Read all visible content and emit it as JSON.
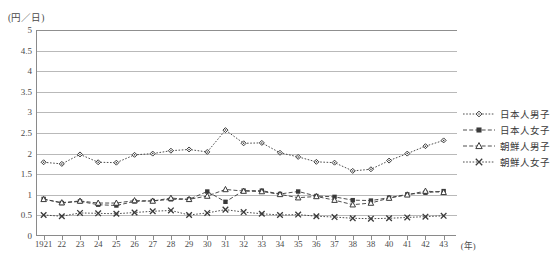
{
  "chart_data": {
    "type": "line",
    "title": "",
    "ylabel": "(円／日)",
    "xlabel": "(年)",
    "ylim": [
      0,
      5
    ],
    "yticks": [
      "0",
      "0.5",
      "1",
      "1.5",
      "2",
      "2.5",
      "3",
      "3.5",
      "4",
      "4.5",
      "5"
    ],
    "grid": true,
    "legend_position": "right",
    "x": [
      "1921",
      "22",
      "23",
      "24",
      "25",
      "26",
      "27",
      "28",
      "29",
      "30",
      "31",
      "32",
      "33",
      "34",
      "35",
      "36",
      "37",
      "38",
      "38",
      "40",
      "41",
      "42",
      "43"
    ],
    "xtick_unit_label": "(年)",
    "series": [
      {
        "name": "日本人男子",
        "marker": "diamond",
        "line": "dotted",
        "values": [
          1.79,
          1.75,
          1.98,
          1.79,
          1.78,
          1.97,
          2.0,
          2.07,
          2.1,
          2.04,
          2.57,
          2.25,
          2.26,
          2.02,
          1.92,
          1.8,
          1.78,
          1.58,
          1.62,
          1.83,
          2.0,
          2.18,
          2.32
        ]
      },
      {
        "name": "日本人女子",
        "marker": "square",
        "line": "dashed",
        "values": [
          0.9,
          0.8,
          0.84,
          0.76,
          0.74,
          0.84,
          0.85,
          0.89,
          0.89,
          1.08,
          0.83,
          1.1,
          1.1,
          1.02,
          1.08,
          0.97,
          0.95,
          0.87,
          0.86,
          0.93,
          1.01,
          1.05,
          1.09
        ]
      },
      {
        "name": "朝鮮人男子",
        "marker": "triangle",
        "line": "dashed",
        "values": [
          0.89,
          0.81,
          0.85,
          0.8,
          0.8,
          0.86,
          0.85,
          0.92,
          0.89,
          0.97,
          1.13,
          1.09,
          1.08,
          1.01,
          0.93,
          0.96,
          0.87,
          0.76,
          0.8,
          0.92,
          1.0,
          1.09,
          1.06
        ]
      },
      {
        "name": "朝鮮人女子",
        "marker": "cross",
        "line": "dotted",
        "values": [
          0.51,
          0.48,
          0.56,
          0.55,
          0.54,
          0.57,
          0.6,
          0.62,
          0.51,
          0.56,
          0.64,
          0.58,
          0.54,
          0.51,
          0.52,
          0.48,
          0.46,
          0.43,
          0.42,
          0.43,
          0.45,
          0.47,
          0.49
        ]
      }
    ]
  },
  "colors": {
    "axis": "#8a8a8a",
    "grid": "#b9b9b9",
    "series": "#3a3a3a",
    "text": "#4a4a4a"
  }
}
